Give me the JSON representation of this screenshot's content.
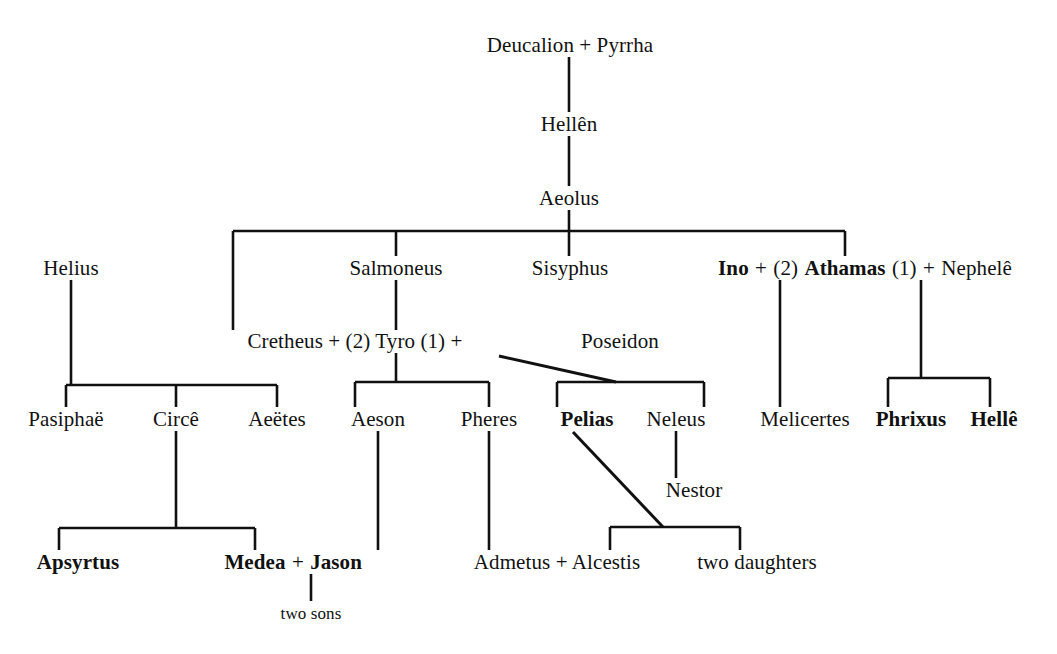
{
  "diagram": {
    "background_color": "#ffffff",
    "line_color": "#111111",
    "text_color": "#111111",
    "width": 1057,
    "height": 654,
    "nodes": [
      {
        "id": "deucalion_pyrrha",
        "x": 570,
        "y": 45,
        "text": "Deucalion + Pyrrha",
        "bold": false
      },
      {
        "id": "hellen",
        "x": 569,
        "y": 124,
        "text": "Hellên",
        "bold": false
      },
      {
        "id": "aeolus",
        "x": 569,
        "y": 198,
        "text": "Aeolus",
        "bold": false
      },
      {
        "id": "helius",
        "x": 71,
        "y": 268,
        "text": "Helius",
        "bold": false
      },
      {
        "id": "salmoneus",
        "x": 396,
        "y": 268,
        "text": "Salmoneus",
        "bold": false
      },
      {
        "id": "sisyphus",
        "x": 570,
        "y": 268,
        "text": "Sisyphus",
        "bold": false
      },
      {
        "id": "melicertes",
        "x": 805,
        "y": 419,
        "text": "Melicertes",
        "bold": false
      },
      {
        "id": "cretheus_tyro",
        "x": 355,
        "y": 341,
        "text": "Cretheus + (2) Tyro (1)  +",
        "bold": false
      },
      {
        "id": "poseidon",
        "x": 620,
        "y": 341,
        "text": "Poseidon",
        "bold": false
      },
      {
        "id": "pasiphae",
        "x": 66,
        "y": 419,
        "text": "Pasiphaë",
        "bold": false
      },
      {
        "id": "circe",
        "x": 176,
        "y": 419,
        "text": "Circê",
        "bold": false
      },
      {
        "id": "aeetes",
        "x": 277,
        "y": 419,
        "text": "Aeëtes",
        "bold": false
      },
      {
        "id": "aeson",
        "x": 378,
        "y": 419,
        "text": "Aeson",
        "bold": false
      },
      {
        "id": "pheres",
        "x": 489,
        "y": 419,
        "text": "Pheres",
        "bold": false
      },
      {
        "id": "pelias",
        "x": 587,
        "y": 419,
        "text": "Pelias",
        "bold": true
      },
      {
        "id": "neleus",
        "x": 676,
        "y": 419,
        "text": "Neleus",
        "bold": false
      },
      {
        "id": "phrixus",
        "x": 911,
        "y": 419,
        "text": "Phrixus",
        "bold": true
      },
      {
        "id": "helle",
        "x": 994,
        "y": 419,
        "text": "Hellê",
        "bold": true
      },
      {
        "id": "nestor",
        "x": 694,
        "y": 490,
        "text": "Nestor",
        "bold": false
      },
      {
        "id": "apsyrtus",
        "x": 78,
        "y": 562,
        "text": "Apsyrtus",
        "bold": true
      },
      {
        "id": "admetus_alcestis",
        "x": 557,
        "y": 562,
        "text": "Admetus + Alcestis",
        "bold": false
      },
      {
        "id": "two_daughters",
        "x": 757,
        "y": 562,
        "text": "two daughters",
        "bold": false
      },
      {
        "id": "two_sons",
        "x": 311,
        "y": 613,
        "text": "two sons",
        "bold": false,
        "small": true
      }
    ],
    "compound_nodes": [
      {
        "id": "ino_athamas_nephele",
        "x": 845,
        "y": 268,
        "parts": [
          {
            "text": "Ino",
            "bold": true
          },
          {
            "text": "+",
            "bold": false
          },
          {
            "text": "(2)",
            "bold": false
          },
          {
            "text": "Athamas",
            "bold": true
          },
          {
            "text": "(1)",
            "bold": false
          },
          {
            "text": "+",
            "bold": false
          },
          {
            "text": "Nephelê",
            "bold": false
          }
        ]
      },
      {
        "id": "medea_jason",
        "x": 320,
        "y": 562,
        "parts": [
          {
            "text": "Medea",
            "bold": true
          },
          {
            "text": "+",
            "bold": false
          },
          {
            "text": "Jason",
            "bold": true
          }
        ]
      }
    ],
    "edges": [
      {
        "id": "deucalion-to-hellen",
        "type": "v",
        "x": 569,
        "y1": 57,
        "y2": 112
      },
      {
        "id": "hellen-to-aeolus",
        "type": "v",
        "x": 569,
        "y1": 136,
        "y2": 186
      },
      {
        "id": "aeolus-to-bus",
        "type": "v",
        "x": 569,
        "y1": 210,
        "y2": 231
      },
      {
        "id": "aeolid-sibling-bus",
        "type": "h",
        "y": 231,
        "x1": 233,
        "x2": 845
      },
      {
        "id": "bus-to-cretheus",
        "type": "v",
        "x": 233,
        "y1": 231,
        "y2": 330
      },
      {
        "id": "bus-to-salmoneus",
        "type": "v",
        "x": 396,
        "y1": 231,
        "y2": 256
      },
      {
        "id": "bus-to-sisyphus",
        "type": "v",
        "x": 569,
        "y1": 231,
        "y2": 256
      },
      {
        "id": "bus-to-athamas",
        "type": "v",
        "x": 845,
        "y1": 231,
        "y2": 256
      },
      {
        "id": "helius-to-bus",
        "type": "v",
        "x": 71,
        "y1": 280,
        "y2": 385
      },
      {
        "id": "helius-children-bus",
        "type": "h",
        "y": 385,
        "x1": 66,
        "x2": 277
      },
      {
        "id": "bus-to-pasiphae",
        "type": "v",
        "x": 66,
        "y1": 385,
        "y2": 407
      },
      {
        "id": "bus-to-circe",
        "type": "v",
        "x": 176,
        "y1": 385,
        "y2": 407
      },
      {
        "id": "bus-to-aeetes",
        "type": "v",
        "x": 277,
        "y1": 385,
        "y2": 407
      },
      {
        "id": "salmoneus-to-tyro",
        "type": "v",
        "x": 396,
        "y1": 280,
        "y2": 330
      },
      {
        "id": "tyro-to-bus",
        "type": "v",
        "x": 396,
        "y1": 353,
        "y2": 382
      },
      {
        "id": "cretheus-children-bus",
        "type": "h",
        "y": 382,
        "x1": 355,
        "x2": 489
      },
      {
        "id": "bus-to-aeson",
        "type": "v",
        "x": 355,
        "y1": 382,
        "y2": 407
      },
      {
        "id": "bus-to-pheres",
        "type": "v",
        "x": 489,
        "y1": 382,
        "y2": 407
      },
      {
        "id": "poseidon-children-bus",
        "type": "h",
        "y": 382,
        "x1": 557,
        "x2": 704
      },
      {
        "id": "bus-to-pelias",
        "type": "v",
        "x": 557,
        "y1": 382,
        "y2": 407
      },
      {
        "id": "bus-to-neleus",
        "type": "v",
        "x": 704,
        "y1": 382,
        "y2": 407
      },
      {
        "id": "tyro-poseidon-diagonal",
        "type": "d",
        "x1": 499,
        "y1": 356,
        "x2": 616,
        "y2": 382
      },
      {
        "id": "athamas-to-melicertes",
        "type": "v",
        "x": 780,
        "y1": 280,
        "y2": 407
      },
      {
        "id": "nephele-to-bus",
        "type": "v",
        "x": 921,
        "y1": 280,
        "y2": 378
      },
      {
        "id": "nephele-children-bus",
        "type": "h",
        "y": 378,
        "x1": 888,
        "x2": 990
      },
      {
        "id": "bus-to-phrixus",
        "type": "v",
        "x": 888,
        "y1": 378,
        "y2": 407
      },
      {
        "id": "bus-to-helle",
        "type": "v",
        "x": 990,
        "y1": 378,
        "y2": 407
      },
      {
        "id": "circe-to-bus",
        "type": "v",
        "x": 176,
        "y1": 431,
        "y2": 528
      },
      {
        "id": "circe-children-bus",
        "type": "h",
        "y": 528,
        "x1": 59,
        "x2": 255
      },
      {
        "id": "bus-to-apsyrtus",
        "type": "v",
        "x": 59,
        "y1": 528,
        "y2": 550
      },
      {
        "id": "bus-to-medea",
        "type": "v",
        "x": 255,
        "y1": 528,
        "y2": 550
      },
      {
        "id": "aeson-to-jason",
        "type": "v",
        "x": 378,
        "y1": 431,
        "y2": 550
      },
      {
        "id": "pheres-to-admetus",
        "type": "v",
        "x": 489,
        "y1": 431,
        "y2": 550
      },
      {
        "id": "neleus-to-nestor",
        "type": "v",
        "x": 676,
        "y1": 431,
        "y2": 478
      },
      {
        "id": "pelias-to-daughters-diagonal",
        "type": "d",
        "x1": 573,
        "y1": 432,
        "x2": 663,
        "y2": 527
      },
      {
        "id": "pelias-children-bus",
        "type": "h",
        "y": 527,
        "x1": 610,
        "x2": 740
      },
      {
        "id": "bus-to-alcestis",
        "type": "v",
        "x": 610,
        "y1": 527,
        "y2": 550
      },
      {
        "id": "bus-to-two-daughters",
        "type": "v",
        "x": 740,
        "y1": 527,
        "y2": 550
      },
      {
        "id": "jason-to-two-sons",
        "type": "v",
        "x": 311,
        "y1": 574,
        "y2": 601
      }
    ]
  }
}
